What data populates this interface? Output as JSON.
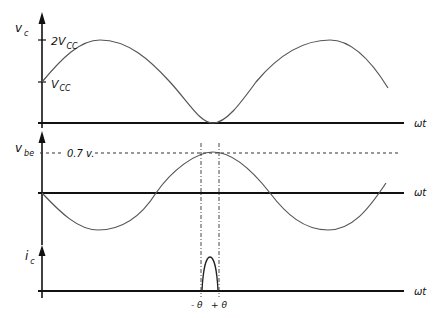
{
  "diagram": {
    "colors": {
      "axis": "#111111",
      "curve": "#555555",
      "guide": "#333333",
      "background": "#ffffff"
    },
    "panels": [
      {
        "id": "vc",
        "ylabel": "v",
        "ylabel_sub": "c",
        "xlabel": "ωt",
        "ticks": [
          {
            "label": "2V",
            "sub": "CC"
          },
          {
            "label": "V",
            "sub": "CC"
          }
        ]
      },
      {
        "id": "vbe",
        "ylabel": "v",
        "ylabel_sub": "be",
        "xlabel": "ωt",
        "threshold_label": "0.7 v."
      },
      {
        "id": "ic",
        "ylabel": "i",
        "ylabel_sub": "c",
        "xlabel": "ωt",
        "conduction_labels": [
          "- θ",
          "+ θ"
        ]
      }
    ]
  }
}
